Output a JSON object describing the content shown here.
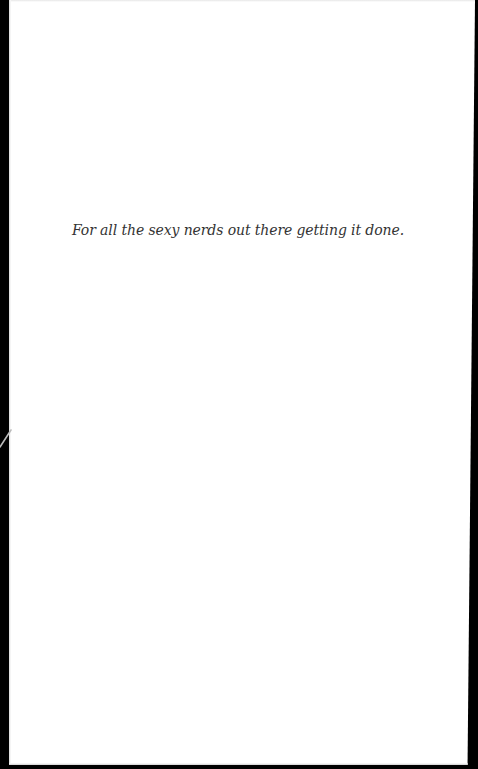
{
  "page": {
    "type": "dedication",
    "dedication_text": "For all the sexy nerds out there getting it done."
  },
  "colors": {
    "background_edge": "#000000",
    "paper": "#ffffff",
    "text": "#333333",
    "scratch": "#bbbbbb"
  }
}
